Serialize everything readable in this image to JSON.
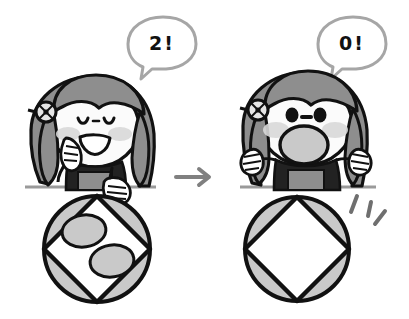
{
  "illustration": {
    "title": "Girl counting shapes inside a circle-and-square figure",
    "panels": [
      {
        "id": "before",
        "position": "left",
        "speech_bubble": {
          "text": "2!",
          "shape": "rounded-oval",
          "tail": "down-left"
        },
        "character": {
          "name": "girl",
          "expression": "happy-smiling",
          "eyes": "closed-curved",
          "mouth": "open-smile",
          "blush": true,
          "pose": "hand-on-chin",
          "hair_color": "#8e8e8e",
          "hair_accessory": "pinwheel-clip",
          "shirt_color": "#222222",
          "skirt_color": "#8e8e8e"
        },
        "figure": {
          "name": "circle-with-inscribed-square",
          "outer_shape": "circle",
          "inner_shape": "square-rotated-45",
          "lune_fill": "#c9c9c9",
          "square_fill": "#ffffff",
          "inner_ellipses": 2,
          "ellipse_fill": "#c9c9c9",
          "held_by_hand": true
        },
        "surface_line": true
      },
      {
        "id": "after",
        "position": "right",
        "speech_bubble": {
          "text": "0!",
          "shape": "rounded-oval",
          "tail": "down-left"
        },
        "character": {
          "name": "girl",
          "expression": "surprised",
          "eyes": "round-open",
          "mouth": "large-open-oval",
          "blush": true,
          "pose": "both-hands-raised",
          "hair_color": "#8e8e8e",
          "hair_accessory": "pinwheel-clip",
          "shirt_color": "#222222",
          "skirt_color": "#8e8e8e"
        },
        "figure": {
          "name": "circle-with-inscribed-square",
          "outer_shape": "circle",
          "inner_shape": "square-rotated-45",
          "lune_fill": "#c9c9c9",
          "square_fill": "#ffffff",
          "inner_ellipses": 0,
          "ellipse_fill": "#c9c9c9",
          "held_by_hand": false
        },
        "surface_line": true,
        "sparkle_lines": 3
      }
    ],
    "transition": {
      "arrow": "right-arrow",
      "color": "#808080"
    },
    "colors": {
      "outline": "#111111",
      "gray_mid": "#8e8e8e",
      "gray_light": "#c9c9c9",
      "blush": "#d8d8d8",
      "line": "#9a9a9a",
      "background": "#ffffff"
    }
  }
}
